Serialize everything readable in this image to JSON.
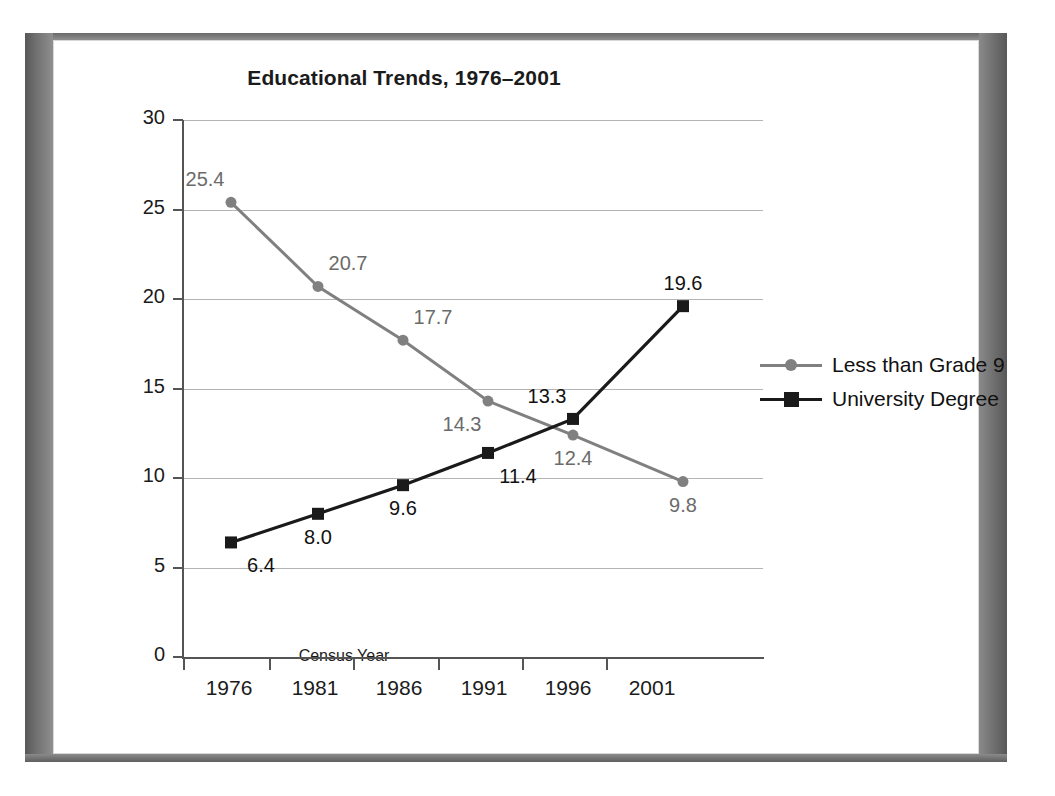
{
  "figure": {
    "frame_style": "drop-shadow-card"
  },
  "chart_data": {
    "type": "line",
    "title": "Educational Trends, 1976–2001",
    "xlabel": "Census Year",
    "ylabel": "Percentage of Population 15 Years and Older",
    "categories": [
      "1976",
      "1981",
      "1986",
      "1991",
      "1996",
      "2001"
    ],
    "x_tick_labels": [
      "1976",
      "1981",
      "1986",
      "1991",
      "1996",
      "2001"
    ],
    "y_tick_labels": [
      "0",
      "5",
      "10",
      "15",
      "20",
      "25",
      "30"
    ],
    "y_ticks": [
      0,
      5,
      10,
      15,
      20,
      25,
      30
    ],
    "ylim": [
      0,
      30
    ],
    "grid": "horizontal",
    "legend_position": "right",
    "series": [
      {
        "name": "Less than Grade 9",
        "color": "#808080",
        "marker": "circle",
        "values": [
          25.4,
          20.7,
          17.7,
          14.3,
          12.4,
          9.8
        ],
        "labels": [
          "25.4",
          "20.7",
          "17.7",
          "14.3",
          "12.4",
          "9.8"
        ],
        "label_positions": [
          "above-left",
          "above-right",
          "above-right",
          "below-left",
          "below",
          "below"
        ]
      },
      {
        "name": "University Degree",
        "color": "#1a1a1a",
        "marker": "square",
        "values": [
          6.4,
          8.0,
          9.6,
          11.4,
          13.3,
          19.6
        ],
        "labels": [
          "6.4",
          "8.0",
          "9.6",
          "11.4",
          "13.3",
          "19.6"
        ],
        "label_positions": [
          "below-right",
          "below",
          "below",
          "below-right",
          "above-left",
          "above"
        ]
      }
    ]
  },
  "legend": {
    "items": [
      {
        "label": "Less than Grade 9",
        "color": "#808080",
        "marker": "circle-marker"
      },
      {
        "label": "University Degree",
        "color": "#1a1a1a",
        "marker": "square-marker"
      }
    ]
  }
}
